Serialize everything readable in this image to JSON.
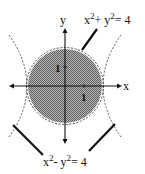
{
  "figure": {
    "type": "math-diagram",
    "axes": {
      "x_label": "x",
      "y_label": "y",
      "tick_x_label": "1",
      "tick_y_label": "1"
    },
    "circle": {
      "equation_lhs": "x",
      "equation_exp1": "2",
      "equation_mid": "+ y",
      "equation_exp2": "2",
      "equation_rhs": "= 4",
      "radius_units": 2,
      "fill_color": "#8a8a8a"
    },
    "hyperbola": {
      "equation_lhs": "x",
      "equation_exp1": "2",
      "equation_mid": "- y",
      "equation_exp2": "2",
      "equation_rhs": "= 4",
      "vertex_units": 2
    },
    "colors": {
      "ink": "#111111",
      "shading": "#8a8a8a",
      "background": "#ffffff"
    }
  }
}
